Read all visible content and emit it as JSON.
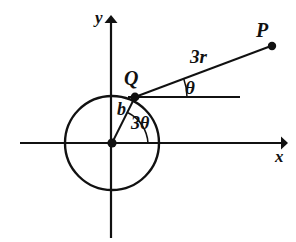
{
  "figure": {
    "type": "geometry-diagram",
    "background_color": "#ffffff",
    "stroke_color": "#111111"
  },
  "labels": {
    "point_p": "P",
    "point_q": "Q",
    "segment_qp": "3r",
    "angle_at_q": "θ",
    "radius": "b",
    "angle_at_origin": "3θ",
    "axis_x": "x",
    "axis_y": "y"
  },
  "geometry": {
    "origin": {
      "x": 112,
      "y": 143
    },
    "circle": {
      "cx": 112,
      "cy": 143,
      "r": 47
    },
    "point_q": {
      "x": 135,
      "y": 97
    },
    "point_p": {
      "x": 272,
      "y": 46
    },
    "x_axis": {
      "x1": 20,
      "y1": 143,
      "x2": 286,
      "y2": 143,
      "arrow": "right"
    },
    "y_axis": {
      "x1": 111,
      "y1": 16,
      "x2": 111,
      "y2": 238,
      "arrow": "up"
    },
    "reference_line_from_q": {
      "x1": 135,
      "y1": 97,
      "x2": 240,
      "y2": 97
    },
    "angle_theta_degrees": 20,
    "angle_3theta_degrees": 63
  }
}
